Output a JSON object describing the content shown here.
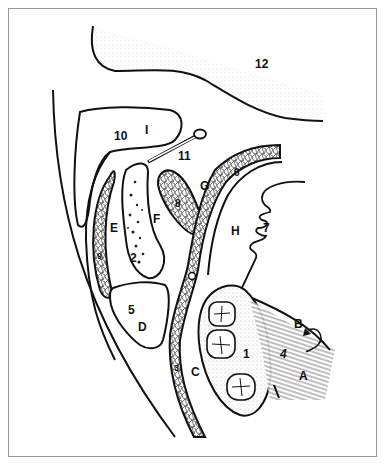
{
  "figure": {
    "type": "anatomical line drawing",
    "stroke_color": "#111111",
    "background": "#ffffff",
    "frame_color": "#9a9a9a"
  },
  "labels": [
    {
      "id": "12",
      "text": "12",
      "x": 255,
      "y": 58
    },
    {
      "id": "10",
      "text": "10",
      "x": 114,
      "y": 130
    },
    {
      "id": "I",
      "text": "I",
      "x": 145,
      "y": 127
    },
    {
      "id": "11",
      "text": "11",
      "x": 178,
      "y": 150
    },
    {
      "id": "G",
      "text": "G",
      "x": 200,
      "y": 180
    },
    {
      "id": "6",
      "text": "6",
      "x": 234,
      "y": 168
    },
    {
      "id": "8",
      "text": "8",
      "x": 173,
      "y": 200
    },
    {
      "id": "E",
      "text": "E",
      "x": 110,
      "y": 222
    },
    {
      "id": "F",
      "text": "F",
      "x": 153,
      "y": 213
    },
    {
      "id": "H",
      "text": "H",
      "x": 231,
      "y": 225
    },
    {
      "id": "7",
      "text": "7",
      "x": 263,
      "y": 223
    },
    {
      "id": "9",
      "text": "9",
      "x": 97,
      "y": 251
    },
    {
      "id": "2",
      "text": "2",
      "x": 130,
      "y": 252
    },
    {
      "id": "5",
      "text": "5",
      "x": 128,
      "y": 306
    },
    {
      "id": "D",
      "text": "D",
      "x": 138,
      "y": 322
    },
    {
      "id": "1",
      "text": "1",
      "x": 243,
      "y": 350
    },
    {
      "id": "B",
      "text": "B",
      "x": 295,
      "y": 321
    },
    {
      "id": "4",
      "text": "4",
      "x": 280,
      "y": 350
    },
    {
      "id": "A",
      "text": "A",
      "x": 299,
      "y": 372
    },
    {
      "id": "3",
      "text": "3",
      "x": 174,
      "y": 365
    },
    {
      "id": "C",
      "text": "C",
      "x": 191,
      "y": 367
    }
  ]
}
